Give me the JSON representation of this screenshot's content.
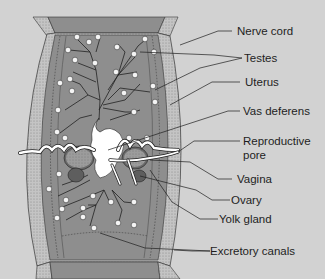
{
  "diagram": {
    "colors": {
      "background": "#d2d2d2",
      "segment_body": "#8e8e8e",
      "segment_border": "#bdbdbd",
      "testes": "#f4f4f4",
      "uterus": "#ffffff",
      "ovary": "#5e5e5e",
      "line": "#1e1e1e"
    },
    "labels": [
      {
        "id": "nerve-cord",
        "text": "Nerve cord"
      },
      {
        "id": "testes",
        "text": "Testes"
      },
      {
        "id": "uterus",
        "text": "Uterus"
      },
      {
        "id": "vas-deferens",
        "text": "Vas deferens"
      },
      {
        "id": "reproductive-pore-1",
        "text": "Reproductive"
      },
      {
        "id": "reproductive-pore-2",
        "text": "pore"
      },
      {
        "id": "vagina",
        "text": "Vagina"
      },
      {
        "id": "ovary",
        "text": "Ovary"
      },
      {
        "id": "yolk-gland",
        "text": "Yolk gland"
      },
      {
        "id": "excretory-canals",
        "text": "Excretory canals"
      }
    ]
  }
}
